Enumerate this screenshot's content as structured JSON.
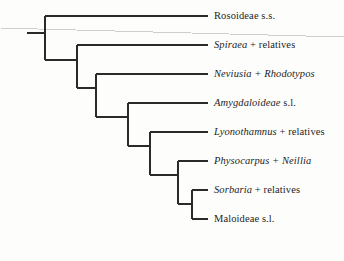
{
  "figure": {
    "type": "phylogenetic-cladogram",
    "background_color": "#fdfdfc",
    "line_color": "#2a2a2a",
    "text_color": "#1d1d1d",
    "artifact_line_color": "#cfcfca"
  },
  "tips": [
    {
      "id": "rosoideae",
      "name_italic": "",
      "name_regular": "Rosoideae s.s.",
      "full_label": "Rosoideae s.s.",
      "y": 16,
      "branch_start_x": 45,
      "branch_end_x": 208,
      "label_x": 214
    },
    {
      "id": "spiraea",
      "name_italic": "Spiraea",
      "name_regular": " + relatives",
      "full_label": "Spiraea + relatives",
      "y": 45,
      "branch_start_x": 77,
      "branch_end_x": 208,
      "label_x": 214
    },
    {
      "id": "neviusia-rhodotypos",
      "name_italic": "Neviusia + Rhodotypos",
      "name_regular": "",
      "full_label": "Neviusia + Rhodotypos",
      "y": 74,
      "branch_start_x": 96,
      "branch_end_x": 208,
      "label_x": 214
    },
    {
      "id": "amygdaloideae",
      "name_italic": "Amygdaloideae",
      "name_regular": " s.l.",
      "full_label": "Amygdaloideae s.l.",
      "y": 103,
      "branch_start_x": 128,
      "branch_end_x": 208,
      "label_x": 214
    },
    {
      "id": "lyonothamnus",
      "name_italic": "Lyonothamnus",
      "name_regular": " + relatives",
      "full_label": "Lyonothamnus + relatives",
      "y": 132,
      "branch_start_x": 150,
      "branch_end_x": 208,
      "label_x": 214
    },
    {
      "id": "physocarpus-neillia",
      "name_italic": "Physocarpus + Neillia",
      "name_regular": "",
      "full_label": "Physocarpus + Neillia",
      "y": 161,
      "branch_start_x": 178,
      "branch_end_x": 208,
      "label_x": 214
    },
    {
      "id": "sorbaria",
      "name_italic": "Sorbaria",
      "name_regular": " + relatives",
      "full_label": "Sorbaria + relatives",
      "y": 190,
      "branch_start_x": 192,
      "branch_end_x": 208,
      "label_x": 214
    },
    {
      "id": "maloideae",
      "name_italic": "",
      "name_regular": "Maloideae s.l.",
      "full_label": "Maloideae s.l.",
      "y": 219,
      "branch_start_x": 192,
      "branch_end_x": 208,
      "label_x": 214
    }
  ],
  "nodes": [
    {
      "id": "root-stem",
      "x1": 27,
      "x2": 45,
      "y": 33
    },
    {
      "id": "node-root",
      "x": 45,
      "y_top": 16,
      "y_bottom": 60
    },
    {
      "id": "node-2-stem",
      "x1": 45,
      "x2": 77,
      "y": 60
    },
    {
      "id": "node-2",
      "x": 77,
      "y_top": 45,
      "y_bottom": 88
    },
    {
      "id": "node-3-stem",
      "x1": 77,
      "x2": 96,
      "y": 88
    },
    {
      "id": "node-3",
      "x": 96,
      "y_top": 74,
      "y_bottom": 117
    },
    {
      "id": "node-4-stem",
      "x1": 96,
      "x2": 128,
      "y": 117
    },
    {
      "id": "node-4",
      "x": 128,
      "y_top": 103,
      "y_bottom": 146
    },
    {
      "id": "node-5-stem",
      "x1": 128,
      "x2": 150,
      "y": 146
    },
    {
      "id": "node-5",
      "x": 150,
      "y_top": 132,
      "y_bottom": 175
    },
    {
      "id": "node-6-stem",
      "x1": 150,
      "x2": 178,
      "y": 175
    },
    {
      "id": "node-6",
      "x": 178,
      "y_top": 161,
      "y_bottom": 204
    },
    {
      "id": "node-7-stem",
      "x1": 178,
      "x2": 192,
      "y": 204
    },
    {
      "id": "node-7",
      "x": 192,
      "y_top": 190,
      "y_bottom": 219
    }
  ],
  "artifact": {
    "id": "scan-crease-line",
    "x1": 0,
    "y1": 28,
    "x2": 344,
    "y2": 37
  }
}
